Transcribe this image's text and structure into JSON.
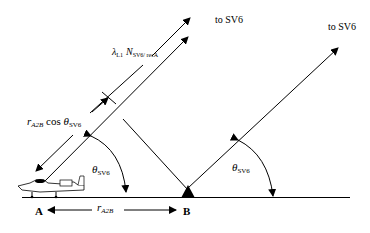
{
  "diagram": {
    "labels": {
      "to_sv6_left": "to SV6",
      "to_sv6_right": "to SV6",
      "lambda_symbol": "λ",
      "lambda_sub": "L1",
      "n_symbol": "N",
      "n_sub": "SV6/ recA",
      "r_a2b_cos_r": "r",
      "r_a2b_cos_sub": "A2B",
      "cos_text": " cos ",
      "theta_symbol": "θ",
      "theta_sub": "SV6",
      "point_a": "A",
      "point_b": "B",
      "baseline_r": "r",
      "baseline_sub": "A2B"
    },
    "elements": {
      "aircraft": "aircraft-at-A",
      "antenna": "ground-station-triangle-at-B"
    },
    "colors": {
      "line": "#000000",
      "background": "#ffffff"
    }
  }
}
